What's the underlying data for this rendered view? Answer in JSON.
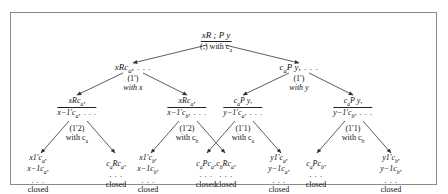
{
  "figure": {
    "type": "proof-tree",
    "border_color": "#8a8a8a",
    "background": "#ffffff"
  },
  "root": {
    "label": "xR ; P y",
    "rule": "(;) with c",
    "rule_sub": "a"
  },
  "level2": [
    {
      "label": "xRc",
      "sub": "a",
      "tail": ", . . ."
    },
    {
      "label": "c",
      "sub": "a",
      "label2": "P y",
      "tail": ", . . ."
    }
  ],
  "rules_level2": [
    {
      "name": "(1′)",
      "with": "with x"
    },
    {
      "name": "(1′)",
      "with": "with y"
    }
  ],
  "level3": [
    {
      "num": "xRc",
      "num_sub": "a",
      "num_tail": ",",
      "den": "x−1′c",
      "den_sub": "a",
      "den_tail": ", . . ."
    },
    {
      "num": "xRc",
      "num_sub": "a",
      "num_tail": ",",
      "den": "x−1′c",
      "den_sub": "b",
      "den_tail": ", . . ."
    },
    {
      "num": "c",
      "num_sub": "a",
      "num_mid": "P y",
      "num_tail": ",",
      "den": "y−1′c",
      "den_sub": "a",
      "den_tail": ", . . ."
    },
    {
      "num": "c",
      "num_sub": "a",
      "num_mid": "P y",
      "num_tail": ",",
      "den": "y−1′c",
      "den_sub": "b",
      "den_tail": ", . . ."
    }
  ],
  "rules_level3": [
    {
      "name": "(1′2)",
      "with": "with c",
      "with_sub": "a"
    },
    {
      "name": "(1′2)",
      "with": "with c",
      "with_sub": "b"
    },
    {
      "name": "(1′1)",
      "with": "with c",
      "with_sub": "a"
    },
    {
      "name": "(1′1)",
      "with": "with c",
      "with_sub": "b"
    }
  ],
  "leaves": [
    {
      "line1": "x1′c",
      "line1_sub": "a",
      "line1_tail": ",",
      "line2": "x−1c",
      "line2_sub": "a",
      "line2_tail": ",",
      "line3": ". . .",
      "status": "closed"
    },
    {
      "line1": "c",
      "line1_sub": "a",
      "line1_mid": "Rc",
      "line1_sub2": "a",
      "line1_tail": ",",
      "line2": ". . .",
      "status": "closed"
    },
    {
      "line1": "x1′c",
      "line1_sub": "b",
      "line1_tail": ",",
      "line2": "x−1c",
      "line2_sub": "b",
      "line2_tail": ",",
      "line3": ". . .",
      "status": "closed"
    },
    {
      "line1": "c",
      "line1_sub": "b",
      "line1_mid": "Rc",
      "line1_sub2": "a",
      "line1_tail": ",",
      "line2": ". . .",
      "status": "closed"
    },
    {
      "line1": "c",
      "line1_sub": "a",
      "line1_mid": "Pc",
      "line1_sub2": "a",
      "line1_tail": ",",
      "line2": ". . .",
      "status": "closed"
    },
    {
      "line1": "y1′c",
      "line1_sub": "a",
      "line1_tail": ",",
      "line2": "y−1c",
      "line2_sub": "a",
      "line2_tail": ",",
      "line3": ". . .",
      "status": "closed"
    },
    {
      "line1": "c",
      "line1_sub": "a",
      "line1_mid": "Pc",
      "line1_sub2": "b",
      "line1_tail": ",",
      "line2": ". . .",
      "status": "closed"
    },
    {
      "line1": "y1′c",
      "line1_sub": "b",
      "line1_tail": ",",
      "line2": "y−1c",
      "line2_sub": "b",
      "line2_tail": ",",
      "line3": ". . .",
      "status": "closed"
    }
  ]
}
